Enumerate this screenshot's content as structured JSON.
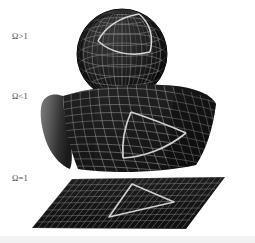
{
  "figure": {
    "title": "Geometry of the universe for different values of the density parameter Omega",
    "background_color": "#ffffff",
    "surface_color": "#1c1c1c",
    "grid_color": "#8d8d8d",
    "highlight_color": "#d8d8d8",
    "label_color": "#4a4a4a"
  },
  "panels": [
    {
      "id": "closed",
      "label": "Ω>1",
      "geometry": "sphere",
      "curvature": "positive",
      "description": "Closed spherical universe with latitude-longitude grid and a spherical triangle whose edges bulge outward",
      "triangle_edges": "convex",
      "label_position": {
        "x": 12,
        "y": 31
      },
      "shape_bounds": {
        "cx": 122,
        "cy": 54,
        "r": 45
      }
    },
    {
      "id": "open",
      "label": "Ω<1",
      "geometry": "saddle",
      "curvature": "negative",
      "description": "Open hyperbolic saddle surface with a curvilinear grid and a triangle whose edges curve inward",
      "triangle_edges": "concave",
      "label_position": {
        "x": 12,
        "y": 91
      },
      "shape_bounds": {
        "x": 38,
        "y": 84,
        "w": 178,
        "h": 90
      }
    },
    {
      "id": "flat",
      "label": "Ω=1",
      "geometry": "plane",
      "curvature": "zero",
      "description": "Flat Euclidean plane shown in perspective with a straight-edged triangle",
      "triangle_edges": "straight",
      "label_position": {
        "x": 12,
        "y": 173
      },
      "shape_bounds": {
        "x": 30,
        "y": 176,
        "w": 195,
        "h": 55
      }
    }
  ]
}
